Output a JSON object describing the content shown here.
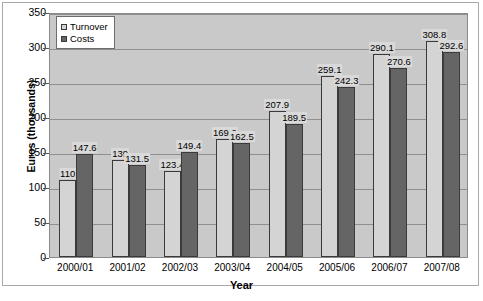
{
  "chart_data": {
    "type": "bar",
    "title": "",
    "xlabel": "Year",
    "ylabel": "Euros (thousands)",
    "categories": [
      "2000/01",
      "2001/02",
      "2002/03",
      "2003/04",
      "2004/05",
      "2005/06",
      "2006/07",
      "2007/08"
    ],
    "series": [
      {
        "name": "Turnover",
        "color": "#d4d4d4",
        "values": [
          110,
          139,
          123.4,
          169.2,
          207.9,
          259.1,
          290.1,
          308.8
        ],
        "labels": [
          "110",
          "139",
          "123.4",
          "169.2",
          "207.9",
          "259.1",
          "290.1",
          "308.8"
        ]
      },
      {
        "name": "Costs",
        "color": "#656565",
        "values": [
          147.6,
          131.5,
          149.4,
          162.5,
          189.5,
          242.3,
          270.6,
          292.6
        ],
        "labels": [
          "147.6",
          "131.5",
          "149.4",
          "162.5",
          "189.5",
          "242.3",
          "270.6",
          "292.6"
        ]
      }
    ],
    "ylim": [
      0,
      350
    ],
    "yticks": [
      0,
      50,
      100,
      150,
      200,
      250,
      300,
      350
    ],
    "ytick_labels": [
      "0",
      "50",
      "100",
      "150",
      "200",
      "250",
      "300",
      "350"
    ],
    "grid": true,
    "legend_position": "top-left",
    "plot_background": "#c9c9c9"
  }
}
